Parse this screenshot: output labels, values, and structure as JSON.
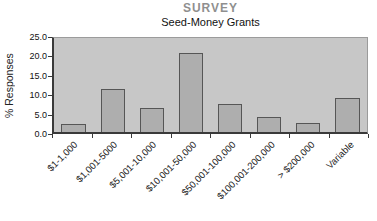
{
  "title": "SURVEY",
  "subtitle": "Seed-Money Grants",
  "y_axis_title": "% Responses",
  "chart_data": {
    "type": "bar",
    "title": "SURVEY",
    "subtitle": "Seed-Money Grants",
    "xlabel": "",
    "ylabel": "% Responses",
    "categories": [
      "$1-1,000",
      "$1,001-5000",
      "$5,001-10,000",
      "$10,001-50,000",
      "$50,001-100,000",
      "$100,001-200,000",
      "> $200,000",
      "Variable"
    ],
    "values": [
      2.0,
      11.5,
      6.5,
      21.0,
      7.5,
      4.0,
      2.5,
      9.0
    ],
    "ylim": [
      0,
      25
    ],
    "ytick_labels": [
      "25.0",
      "20.0",
      "15.0",
      "10.0",
      "5.0",
      "0.0"
    ],
    "yticks": [
      25,
      20,
      15,
      10,
      5,
      0
    ],
    "grid": false,
    "legend": "none",
    "colors": {
      "plot_background": "#c7c7c7",
      "bar_fill": "#aeaeae",
      "bar_border": "#565656",
      "title_text": "#8f8f8f",
      "subtitle_text": "#111111",
      "axis_line": "#3a3a3a"
    }
  }
}
